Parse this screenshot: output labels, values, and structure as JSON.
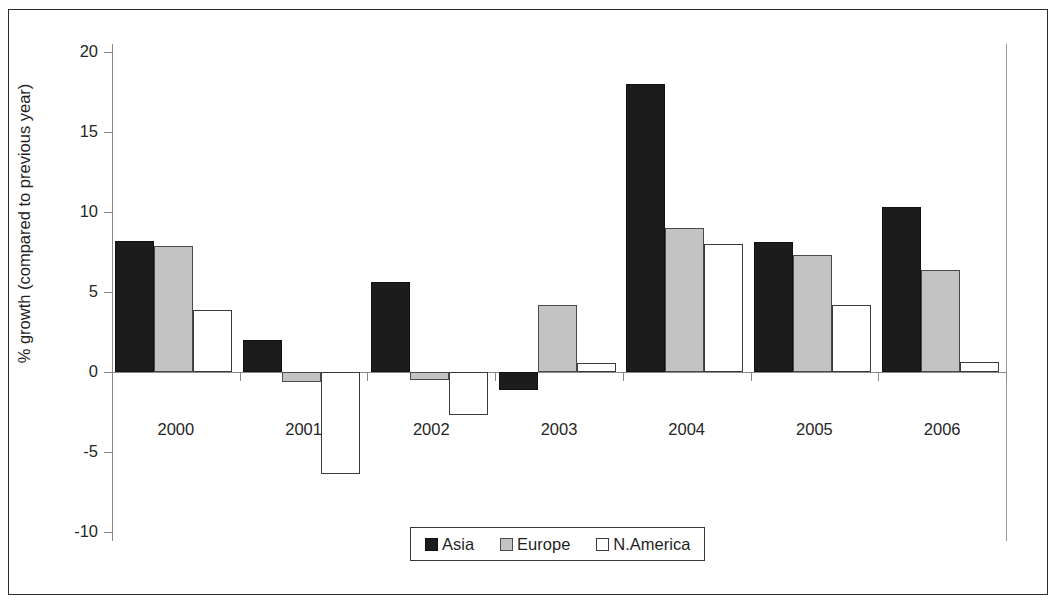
{
  "chart_data": {
    "type": "bar",
    "title": "",
    "xlabel": "",
    "ylabel": "% growth (compared to previous year)",
    "categories": [
      "2000",
      "2001",
      "2002",
      "2003",
      "2004",
      "2005",
      "2006"
    ],
    "series": [
      {
        "name": "Asia",
        "values": [
          8.2,
          2.0,
          5.6,
          -1.1,
          18.0,
          8.1,
          10.3
        ]
      },
      {
        "name": "Europe",
        "values": [
          7.9,
          -0.6,
          -0.5,
          4.2,
          9.0,
          7.3,
          6.4
        ]
      },
      {
        "name": "N.America",
        "values": [
          3.9,
          -6.4,
          -2.7,
          0.55,
          8.0,
          4.2,
          0.65
        ]
      }
    ],
    "ylim": [
      -10,
      20
    ],
    "yticks": [
      20,
      15,
      10,
      5,
      0,
      -5,
      -10
    ],
    "ytick_labels": [
      "20",
      "15",
      "10",
      "5",
      "0",
      "-5",
      "-10"
    ],
    "grid": false,
    "legend_position": "bottom-center",
    "legend": [
      "Asia",
      "Europe",
      "N.America"
    ],
    "colors": {
      "asia": "#1c1c1c",
      "europe": "#c3c3c3",
      "namerica": "#ffffff",
      "outline": "#3a3a3a",
      "axis": "#8a8a8a",
      "frame": "#2b2b2b",
      "text": "#1f1f1f"
    }
  }
}
